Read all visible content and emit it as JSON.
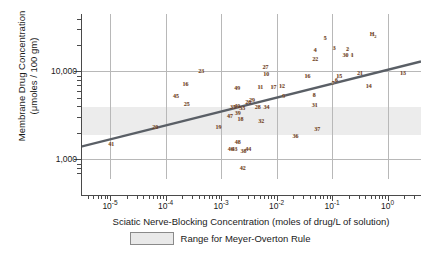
{
  "chart_data": {
    "type": "scatter",
    "title": "",
    "xlabel": "Sciatic Nerve-Blocking Concentration (moles of drug/L of solution)",
    "ylabel_line1": "Membrane Drug Concentration",
    "ylabel_line2": "(μmoles / 100 gm)",
    "xscale": "log",
    "yscale": "log",
    "xlim": [
      3e-06,
      4.0
    ],
    "ylim": [
      600,
      45000
    ],
    "grid": true,
    "legend_position": "below-axis",
    "xticklabels": [
      "10-5",
      "10-4",
      "10-3",
      "10-2",
      "10-1",
      "100"
    ],
    "xtickvalues": [
      1e-05,
      0.0001,
      0.001,
      0.01,
      0.1,
      1
    ],
    "yticklabels": [
      "10,000",
      "1,000"
    ],
    "ytickvalues": [
      10000,
      1000
    ],
    "legend": [
      {
        "label": "Range for Meyer-Overton Rule",
        "color": "#e9e9e9"
      }
    ],
    "shaded_band": {
      "label": "Range for Meyer-Overton Rule",
      "ymin": 1900,
      "ymax": 3900,
      "color": "#e9e9e9"
    },
    "trendline": {
      "label": "Meyer-Overton regression",
      "color": "#5a5f66",
      "x1": 3e-06,
      "y1": 1400,
      "x2": 4.0,
      "y2": 13000
    },
    "points": [
      {
        "label": "41",
        "x": 1.05e-05,
        "y": 1500
      },
      {
        "label": "20",
        "x": 6.5e-05,
        "y": 2350
      },
      {
        "label": "45",
        "x": 0.000155,
        "y": 5300
      },
      {
        "label": "16",
        "x": 0.00023,
        "y": 7200
      },
      {
        "label": "25",
        "x": 0.00024,
        "y": 4300
      },
      {
        "label": "23",
        "x": 0.00044,
        "y": 10200
      },
      {
        "label": "19",
        "x": 0.0009,
        "y": 2350
      },
      {
        "label": "47",
        "x": 0.00145,
        "y": 3150
      },
      {
        "label": "35",
        "x": 0.00165,
        "y": 3900
      },
      {
        "label": "40",
        "x": 0.00195,
        "y": 4100
      },
      {
        "label": "49",
        "x": 0.00195,
        "y": 6500
      },
      {
        "label": "39",
        "x": 0.002,
        "y": 3350
      },
      {
        "label": "46",
        "x": 0.0015,
        "y": 1300
      },
      {
        "label": "43",
        "x": 0.00175,
        "y": 1330
      },
      {
        "label": "48",
        "x": 0.002,
        "y": 1600
      },
      {
        "label": "33",
        "x": 0.0024,
        "y": 3800
      },
      {
        "label": "18",
        "x": 0.00225,
        "y": 2850
      },
      {
        "label": "38",
        "x": 0.00255,
        "y": 1250
      },
      {
        "label": "44",
        "x": 0.0031,
        "y": 1330
      },
      {
        "label": "42",
        "x": 0.00245,
        "y": 800
      },
      {
        "label": "26",
        "x": 0.0031,
        "y": 4450
      },
      {
        "label": "29",
        "x": 0.0036,
        "y": 4700
      },
      {
        "label": "11",
        "x": 0.0051,
        "y": 6600
      },
      {
        "label": "28",
        "x": 0.0046,
        "y": 3950
      },
      {
        "label": "32",
        "x": 0.0053,
        "y": 2750
      },
      {
        "label": "27",
        "x": 0.0063,
        "y": 11200
      },
      {
        "label": "10",
        "x": 0.0065,
        "y": 9300
      },
      {
        "label": "34",
        "x": 0.0066,
        "y": 3950
      },
      {
        "label": "17",
        "x": 0.0088,
        "y": 6700
      },
      {
        "label": "12",
        "x": 0.0125,
        "y": 6900
      },
      {
        "label": "9",
        "x": 0.0135,
        "y": 5300
      },
      {
        "label": "36",
        "x": 0.022,
        "y": 1850
      },
      {
        "label": "16b",
        "x": 0.036,
        "y": 9000
      },
      {
        "label": "8",
        "x": 0.048,
        "y": 5400
      },
      {
        "label": "31",
        "x": 0.049,
        "y": 4200
      },
      {
        "label": "22",
        "x": 0.05,
        "y": 14000
      },
      {
        "label": "4",
        "x": 0.05,
        "y": 17500
      },
      {
        "label": "37",
        "x": 0.054,
        "y": 2200
      },
      {
        "label": "5",
        "x": 0.075,
        "y": 24000
      },
      {
        "label": "7",
        "x": 0.105,
        "y": 7400
      },
      {
        "label": "3",
        "x": 0.11,
        "y": 18500
      },
      {
        "label": "6",
        "x": 0.12,
        "y": 8000
      },
      {
        "label": "15",
        "x": 0.135,
        "y": 9000
      },
      {
        "label": "30",
        "x": 0.175,
        "y": 15200
      },
      {
        "label": "2",
        "x": 0.19,
        "y": 18200
      },
      {
        "label": "1",
        "x": 0.23,
        "y": 15300
      },
      {
        "label": "21",
        "x": 0.32,
        "y": 9500
      },
      {
        "label": "14",
        "x": 0.46,
        "y": 6900
      },
      {
        "label": "H2",
        "x": 0.55,
        "y": 26000
      },
      {
        "label": "13",
        "x": 1.9,
        "y": 9700
      }
    ]
  },
  "axes": {
    "y_title_line1": "Membrane Drug Concentration",
    "y_title_line2": "(μmoles / 100 gm)",
    "x_title": "Sciatic Nerve-Blocking Concentration (moles of drug/L of solution)",
    "y_ticks": [
      {
        "label": "10,000",
        "value": 10000
      },
      {
        "label": "1,000",
        "value": 1000
      }
    ],
    "x_ticks": [
      {
        "mantissa": "10",
        "exponent": "-5",
        "value": 1e-05
      },
      {
        "mantissa": "10",
        "exponent": "-4",
        "value": 0.0001
      },
      {
        "mantissa": "10",
        "exponent": "-3",
        "value": 0.001
      },
      {
        "mantissa": "10",
        "exponent": "-2",
        "value": 0.01
      },
      {
        "mantissa": "10",
        "exponent": "-1",
        "value": 0.1
      },
      {
        "mantissa": "10",
        "exponent": "0",
        "value": 1
      }
    ]
  },
  "legend": {
    "swatch_color": "#e9e9e9",
    "label": "Range for Meyer-Overton Rule"
  },
  "colors": {
    "point_label": "#6b3a20",
    "trendline": "#5a5f66",
    "band": "#e9e9e9",
    "grid": "#b8b8b8",
    "axis": "#4a4a4a"
  }
}
